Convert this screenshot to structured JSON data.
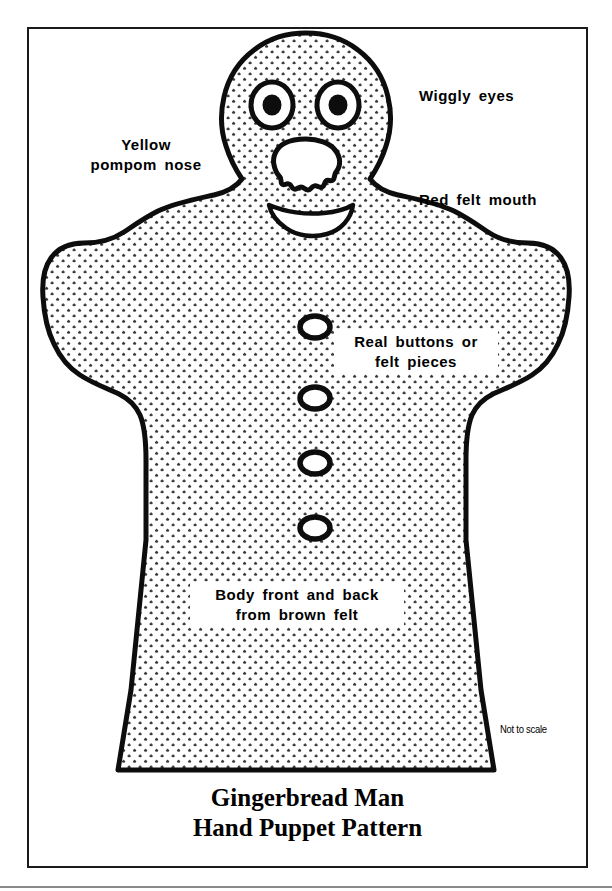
{
  "page": {
    "title_line_1": "Gingerbread Man",
    "title_line_2": "Hand Puppet Pattern",
    "scale_note": "Not to scale"
  },
  "callouts": [
    {
      "id": "wiggly-eyes",
      "text": "Wiggly  eyes"
    },
    {
      "id": "yellow-pompom",
      "text": "Yellow pompom nose"
    },
    {
      "id": "red-felt-mouth",
      "text": "Red  felt  mouth"
    },
    {
      "id": "real-buttons",
      "text": "Real  buttons  or felt  pieces"
    },
    {
      "id": "body-front",
      "text": "Body  front  and  back from  brown  felt"
    }
  ],
  "colors": {
    "ink": "#000000",
    "outline": "#1a1a1a",
    "paper": "#ffffff",
    "stipple": "#3a3a3a",
    "frame": "#1a1a1a",
    "scan_rule": "#8a8a8a"
  },
  "figure": {
    "name": "gingerbread-man-puppet-pattern",
    "features": {
      "eyes": 2,
      "nose": 1,
      "mouth": 1,
      "buttons": 4
    }
  }
}
